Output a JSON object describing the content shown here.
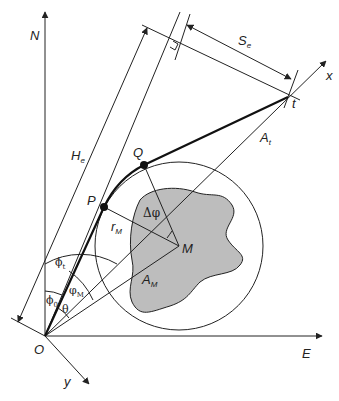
{
  "diagram": {
    "type": "geometry",
    "colors": {
      "line": "#222222",
      "fill_shape": "#bdbdbd",
      "background": "#ffffff"
    },
    "labels": {
      "north": "N",
      "east": "E",
      "x_axis": "x",
      "y_axis": "y",
      "origin": "O",
      "target": "t",
      "point_p": "P",
      "point_q": "Q",
      "center": "M",
      "range_target": "A",
      "range_target_sub": "t",
      "range_center": "A",
      "range_center_sub": "M",
      "radius": "r",
      "radius_sub": "M",
      "height": "H",
      "height_sub": "e",
      "span": "S",
      "span_sub": "e",
      "delta_phi": "Δφ",
      "phi_t": "ϕ",
      "phi_t_sub": "t",
      "phi_0": "ϕ",
      "phi_0_sub": "0",
      "phi_m": "φ",
      "phi_m_sub": "M",
      "theta": "θ"
    }
  }
}
